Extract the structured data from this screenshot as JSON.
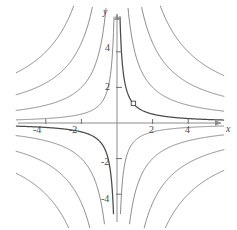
{
  "figure": {
    "kind": "contour-plot-hyperbolas",
    "background_color": "#ffffff",
    "curve_color": "#6e6e6e",
    "highlight_curve_color": "#4a4a4a",
    "axis_color": "#8c8c8c",
    "label_color": "#4a4a4a"
  },
  "axes": {
    "x_label": "x",
    "y_label": "y",
    "x_ticks": [
      {
        "value": -4,
        "label": "-4"
      },
      {
        "value": -2,
        "label": "-2"
      },
      {
        "value": 2,
        "label": "2"
      },
      {
        "value": 4,
        "label": "4"
      }
    ],
    "y_ticks": [
      {
        "value": -4,
        "label": "-4"
      },
      {
        "value": -2,
        "label": "-2"
      },
      {
        "value": 2,
        "label": "2"
      },
      {
        "value": 4,
        "label": "4"
      }
    ]
  },
  "marker": {
    "name": "point-marker",
    "shape": "open-square",
    "x": 1,
    "y": 1
  },
  "chart_data": {
    "type": "line",
    "title": "",
    "xlabel": "x",
    "ylabel": "y",
    "xlim": [
      -6.6,
      6.7
    ],
    "ylim": [
      -6.0,
      6.3
    ],
    "grid": false,
    "legend": "none",
    "x_ticks": [
      -4,
      -2,
      2,
      4
    ],
    "y_ticks": [
      -4,
      -2,
      2,
      4
    ],
    "annotations": [
      {
        "type": "open-square-marker",
        "x": 1,
        "y": 1,
        "on_curve": 1
      }
    ],
    "series": [
      {
        "name": "xy = 1",
        "level": 1,
        "branches": [
          "quadrant-I",
          "quadrant-III"
        ],
        "highlighted": true
      },
      {
        "name": "xy = 4",
        "level": 4,
        "branches": [
          "quadrant-I",
          "quadrant-III"
        ],
        "highlighted": false
      },
      {
        "name": "xy = 9",
        "level": 9,
        "branches": [
          "quadrant-I",
          "quadrant-III"
        ],
        "highlighted": false
      },
      {
        "name": "xy = 16",
        "level": 16,
        "branches": [
          "quadrant-I",
          "quadrant-III"
        ],
        "highlighted": false
      },
      {
        "name": "xy = -1",
        "level": -1,
        "branches": [
          "quadrant-II",
          "quadrant-IV"
        ],
        "highlighted": false
      },
      {
        "name": "xy = -4",
        "level": -4,
        "branches": [
          "quadrant-II",
          "quadrant-IV"
        ],
        "highlighted": false
      },
      {
        "name": "xy = -9",
        "level": -9,
        "branches": [
          "quadrant-II",
          "quadrant-IV"
        ],
        "highlighted": false
      },
      {
        "name": "xy = -16",
        "level": -16,
        "branches": [
          "quadrant-II",
          "quadrant-IV"
        ],
        "highlighted": false
      }
    ]
  }
}
